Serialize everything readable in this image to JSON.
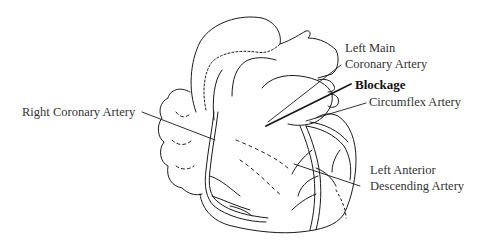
{
  "diagram": {
    "labels": {
      "right_coronary": "Right Coronary Artery",
      "left_main_line1": "Left Main",
      "left_main_line2": "Coronary Artery",
      "blockage": "Blockage",
      "circumflex": "Circumflex Artery",
      "lad_line1": "Left Anterior",
      "lad_line2": "Descending Artery"
    }
  }
}
